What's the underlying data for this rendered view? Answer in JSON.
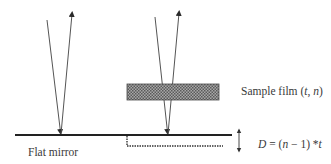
{
  "diagram": {
    "type": "optical-schematic",
    "colors": {
      "background": "#ffffff",
      "line": "#2a2a2a",
      "ray": "#555555",
      "film_fill": "#8a8a8a",
      "text": "#3a3a3a"
    },
    "labels": {
      "sample_film": "Sample film (t, n)",
      "sample_film_prefix": "Sample film (",
      "sample_film_t": "t",
      "sample_film_sep": ", ",
      "sample_film_n": "n",
      "sample_film_suffix": ")",
      "displacement": "D = (n − 1) *t",
      "displacement_D": "D",
      "displacement_mid1": " = (",
      "displacement_n": "n",
      "displacement_mid2": " − 1) *",
      "displacement_t": "t",
      "flat_mirror": "Flat mirror"
    },
    "elements": {
      "left_ray": {
        "incident_start": [
          47,
          20
        ],
        "reflection_point": [
          61,
          134
        ],
        "reflected_end": [
          72,
          13
        ]
      },
      "right_ray": {
        "incident_start": [
          155,
          17
        ],
        "reflection_point": [
          168,
          134
        ],
        "reflected_end": [
          179,
          12
        ]
      },
      "sample_film_rect": {
        "x": 127,
        "y": 84,
        "width": 92,
        "height": 16
      },
      "flat_mirror_line": {
        "x1": 15,
        "x2": 232,
        "y": 135
      },
      "virtual_surface": {
        "step_x": 127,
        "y": 146,
        "x2": 223
      },
      "displacement_arrow": {
        "x": 239,
        "y1": 129,
        "y2": 152
      }
    }
  }
}
